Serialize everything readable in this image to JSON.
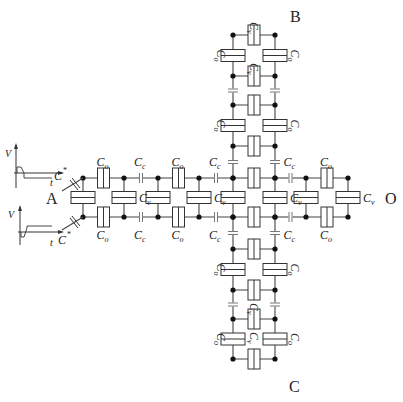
{
  "figure": {
    "ports": {
      "A": "A",
      "B": "B",
      "C": "C",
      "O": "O"
    },
    "labels": {
      "Co": "C",
      "Co_sub": "o",
      "Cc": "C",
      "Cc_sub": "c",
      "Cv": "C",
      "Cv_sub": "v",
      "Cstar": "C",
      "Cstar_sup": "*",
      "V": "V",
      "t": "t"
    },
    "waveforms": [
      {
        "name": "top-input",
        "type": "negative-step",
        "axis_v": "V",
        "axis_t": "t"
      },
      {
        "name": "bottom-input",
        "type": "positive-step",
        "axis_v": "V",
        "axis_t": "t"
      }
    ],
    "horizontal_arm": {
      "top_y": 178,
      "bottom_y": 217,
      "node_x": [
        83,
        124,
        158,
        199,
        233,
        275,
        306,
        348
      ],
      "series_types": [
        "Co",
        "Cc",
        "Co",
        "Cc",
        "box",
        "Cc",
        "Co"
      ],
      "series_labels": [
        "Co",
        "Cc",
        "Co",
        "Cc",
        "",
        "Cc",
        "Co"
      ],
      "shunt_labels": [
        "",
        "Cv",
        "",
        "Cv",
        "",
        "Cv",
        "",
        "Cv"
      ]
    },
    "vertical_arm": {
      "left_x": 233,
      "right_x": 275,
      "top_nodes_y": [
        35,
        76,
        105,
        146,
        178
      ],
      "bottom_nodes_y": [
        217,
        249,
        290,
        319,
        359
      ],
      "top_series_types": [
        "Co",
        "Cc",
        "Co",
        "Cc"
      ],
      "bottom_series_types": [
        "Cc",
        "Co",
        "Cc",
        "Co"
      ],
      "top_rung_labels": [
        "Cv",
        "Cv",
        "",
        ""
      ],
      "bottom_rung_labels": [
        "",
        "",
        "Cv",
        "Cv"
      ]
    }
  }
}
